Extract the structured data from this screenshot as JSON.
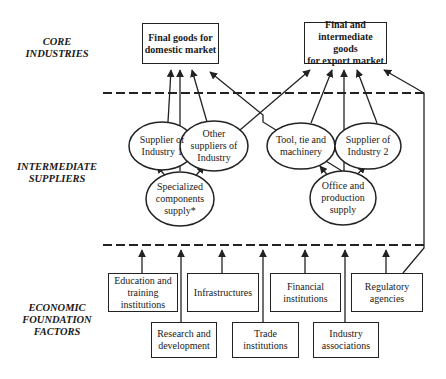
{
  "tiers": {
    "core": [
      "CORE",
      "INDUSTRIES"
    ],
    "intermediate": [
      "INTERMEDIATE",
      "SUPPLIERS"
    ],
    "foundation": [
      "ECONOMIC",
      "FOUNDATION",
      "FACTORS"
    ]
  },
  "core_boxes": {
    "domestic": [
      "Final goods for",
      "domestic market"
    ],
    "export": [
      "Final and",
      "intermediate goods",
      "for export market"
    ]
  },
  "suppliers": {
    "supplier1": [
      "Supplier of",
      "Industry 1"
    ],
    "other": [
      "Other",
      "suppliers of",
      "Industry"
    ],
    "tool": [
      "Tool, tie and",
      "machinery"
    ],
    "supplier2": [
      "Supplier of",
      "Industry 2"
    ],
    "specialized": [
      "Specialized",
      "components",
      "supply*"
    ],
    "office": [
      "Office and",
      "production",
      "supply"
    ]
  },
  "foundation_boxes": {
    "education": [
      "Education and",
      "training institutions"
    ],
    "infrastructures": [
      "Infrastructures"
    ],
    "financial": [
      "Financial",
      "institutions"
    ],
    "regulatory": [
      "Regulatory",
      "agencies"
    ],
    "research": [
      "Research and",
      "development"
    ],
    "trade": [
      "Trade",
      "institutions"
    ],
    "industry": [
      "Industry",
      "associations"
    ]
  },
  "colors": {
    "line": "#222222",
    "background": "#ffffff"
  }
}
